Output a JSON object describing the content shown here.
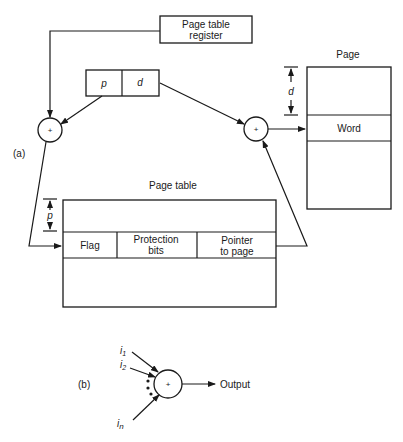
{
  "part_a": {
    "label": "(a)",
    "register": {
      "line1": "Page table",
      "line2": "register"
    },
    "address": {
      "p": "p",
      "d": "d"
    },
    "adder_left": "+",
    "adder_right": "+",
    "page": {
      "title": "Page",
      "word": "Word",
      "offset_label": "d"
    },
    "page_table": {
      "title": "Page table",
      "offset_label": "p",
      "flag": "Flag",
      "protection": {
        "line1": "Protection",
        "line2": "bits"
      },
      "pointer": {
        "line1": "Pointer",
        "line2": "to page"
      }
    }
  },
  "part_b": {
    "label": "(b)",
    "adder": "+",
    "inputs": [
      {
        "name": "i",
        "sub": "1"
      },
      {
        "name": "i",
        "sub": "2"
      },
      {
        "name": "i",
        "sub": "n"
      }
    ],
    "output": "Output"
  }
}
